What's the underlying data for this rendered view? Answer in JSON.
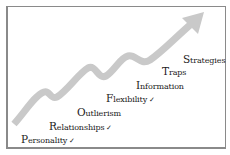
{
  "diagram": {
    "type": "growth-staircase",
    "arrow_color": "#c9c9c9",
    "steps": [
      {
        "first": "P",
        "rest": "ersonality",
        "checked": "✓"
      },
      {
        "first": "R",
        "rest": "elationships",
        "checked": "✓"
      },
      {
        "first": "O",
        "rest": "utlierism",
        "checked": ""
      },
      {
        "first": "F",
        "rest": "lexibility",
        "checked": "✓"
      },
      {
        "first": "I",
        "rest": "nformation",
        "checked": ""
      },
      {
        "first": "T",
        "rest": "raps",
        "checked": ""
      },
      {
        "first": "S",
        "rest": "trategies",
        "checked": ""
      }
    ]
  }
}
